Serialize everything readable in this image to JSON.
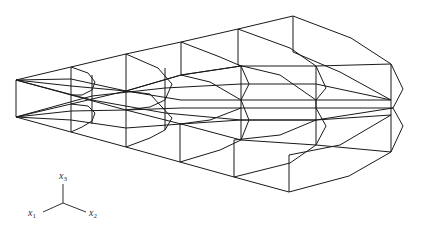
{
  "figure": {
    "type": "3d-wireframe-mesh",
    "stroke_color": "#1a1a1a"
  },
  "axes": {
    "x1": {
      "label": "x",
      "sub": "1"
    },
    "x2": {
      "label": "x",
      "sub": "2"
    },
    "x3": {
      "label": "x",
      "sub": "3"
    }
  }
}
